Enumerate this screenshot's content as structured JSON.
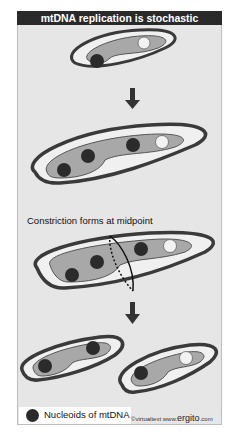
{
  "title": "mtDNA  replication is stochastic",
  "caption": "Constriction forms at midpoint",
  "legend": {
    "label": "Nucleoids of mtDNA",
    "dot_color": "#2b2b2b"
  },
  "credit": {
    "prefix": "©virtualtext  www.",
    "brand": "ergito",
    "suffix": ".com"
  },
  "colors": {
    "background": "#e6e6e6",
    "header": "#2a2a2a",
    "outer_membrane": "#3a3a3a",
    "matrix": "#a8a8a8",
    "nucleoid": "#2b2b2b",
    "empty_nucleoid": "#f2f2f2"
  },
  "stages": [
    {
      "name": "initial",
      "nucleoids_filled": 1,
      "nucleoids_empty": 1
    },
    {
      "name": "replicated",
      "nucleoids_filled": 3,
      "nucleoids_empty": 1
    },
    {
      "name": "constriction",
      "nucleoids_filled": 3,
      "nucleoids_empty": 1
    },
    {
      "name": "daughter-left",
      "nucleoids_filled": 2,
      "nucleoids_empty": 0
    },
    {
      "name": "daughter-right",
      "nucleoids_filled": 1,
      "nucleoids_empty": 1
    }
  ]
}
